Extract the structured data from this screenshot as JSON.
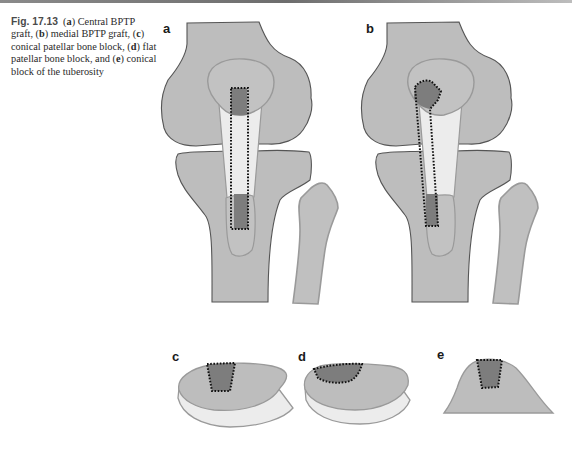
{
  "caption": {
    "figure_number": "Fig. 17.13",
    "parts": [
      {
        "label": "a",
        "text": "Central BPTP graft,"
      },
      {
        "label": "b",
        "text": "medial BPTP graft,"
      },
      {
        "label": "c",
        "text": "conical patellar bone block,"
      },
      {
        "label": "d",
        "text": "flat patellar bone block, and"
      },
      {
        "label": "e",
        "text": "conical block of the tuberosity"
      }
    ]
  },
  "panels": {
    "a": {
      "label": "a",
      "title": "Central BPTP graft"
    },
    "b": {
      "label": "b",
      "title": "Medial BPTP graft"
    },
    "c": {
      "label": "c",
      "title": "Conical patellar bone block"
    },
    "d": {
      "label": "d",
      "title": "Flat patellar bone block"
    },
    "e": {
      "label": "e",
      "title": "Conical block of the tuberosity"
    }
  },
  "colors": {
    "bone_fill": "#bdbdbd",
    "bone_stroke": "#8f8f8f",
    "outline_dark": "#555555",
    "tendon_fill": "#ececec",
    "graft_block_fill": "#7d7d7d",
    "dotted_outline": "#111111",
    "top_rule": "#6d6d6d"
  }
}
